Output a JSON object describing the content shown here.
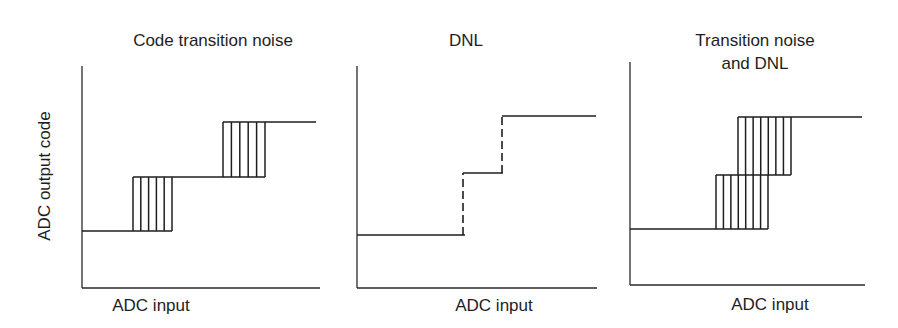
{
  "figure": {
    "y_axis_label": "ADC output code",
    "panels": [
      {
        "id": "code-transition-noise",
        "title_lines": [
          "Code transition noise"
        ],
        "x_axis_label": "ADC input",
        "axes": {
          "x0": 82,
          "y_top": 66,
          "y_bottom": 288,
          "x_end": 320
        },
        "levels": [
          {
            "y": 231,
            "x1": 82,
            "x2": 172
          },
          {
            "y": 177,
            "x1": 133,
            "x2": 265
          },
          {
            "y": 122,
            "x1": 223,
            "x2": 316
          }
        ],
        "hatched_boxes": [
          {
            "x1": 133,
            "x2": 172,
            "y_top": 177,
            "y_bottom": 231,
            "lines": 6
          },
          {
            "x1": 223,
            "x2": 265,
            "y_top": 122,
            "y_bottom": 177,
            "lines": 6
          }
        ],
        "dashed_risers": []
      },
      {
        "id": "dnl",
        "title_lines": [
          "DNL"
        ],
        "x_axis_label": "ADC input",
        "axes": {
          "x0": 357,
          "y_top": 66,
          "y_bottom": 288,
          "x_end": 597
        },
        "levels": [
          {
            "y": 235,
            "x1": 357,
            "x2": 465
          },
          {
            "y": 173,
            "x1": 463,
            "x2": 503
          },
          {
            "y": 116,
            "x1": 502,
            "x2": 596
          }
        ],
        "hatched_boxes": [],
        "dashed_risers": [
          {
            "x": 463,
            "y1": 235,
            "y2": 173
          },
          {
            "x": 502,
            "y1": 173,
            "y2": 116
          }
        ]
      },
      {
        "id": "transition-noise-and-dnl",
        "title_lines": [
          "Transition noise",
          "and DNL"
        ],
        "x_axis_label": "ADC input",
        "axes": {
          "x0": 630,
          "y_top": 62,
          "y_bottom": 285,
          "x_end": 865
        },
        "levels": [
          {
            "y": 229,
            "x1": 630,
            "x2": 768
          },
          {
            "y": 175,
            "x1": 716,
            "x2": 791
          },
          {
            "y": 117,
            "x1": 738,
            "x2": 862
          }
        ],
        "hatched_boxes": [
          {
            "x1": 716,
            "x2": 768,
            "y_top": 175,
            "y_bottom": 229,
            "lines": 8
          },
          {
            "x1": 738,
            "x2": 791,
            "y_top": 117,
            "y_bottom": 175,
            "lines": 8
          }
        ],
        "dashed_risers": []
      }
    ],
    "colors": {
      "ink": "#1e1e1e",
      "background": "#ffffff"
    }
  }
}
